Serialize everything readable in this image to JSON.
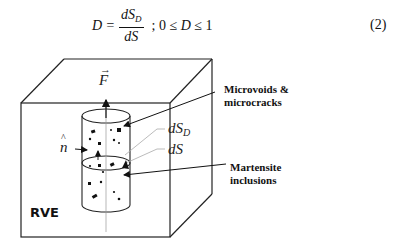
{
  "equation": {
    "lhs": "D =",
    "numerator": "dS",
    "numerator_sub": "D",
    "denominator": "dS",
    "separator": ";",
    "constraint_prefix": "0 ≤ ",
    "constraint_var": "D",
    "constraint_suffix": " ≤ 1",
    "number": "(2)"
  },
  "diagram": {
    "force_label": "F",
    "force_accent": "→",
    "normal_label": "n",
    "normal_accent": "^",
    "dSD_label": "dS",
    "dSD_sub": "D",
    "dS_label": "dS",
    "rve_label": "RVE",
    "callout_voids_line1": "Microvoids &",
    "callout_voids_line2": "microcracks",
    "callout_martensite_line1": "Martensite",
    "callout_martensite_line2": "inclusions"
  }
}
